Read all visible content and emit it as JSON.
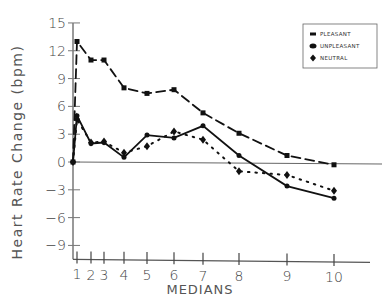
{
  "chart_data": {
    "type": "line",
    "title": "",
    "xlabel": "MEDIANS",
    "ylabel": "Heart Rate Change (bpm)",
    "x": [
      0,
      1,
      2,
      3,
      4,
      5,
      6,
      7,
      8,
      9,
      10
    ],
    "x_tick_labels": [
      "1",
      "2",
      "3",
      "4",
      "5",
      "6",
      "7",
      "8",
      "9",
      "10"
    ],
    "y_ticks": [
      15,
      12,
      9,
      6,
      3,
      0,
      -3,
      -6,
      -9
    ],
    "ylim": [
      -10,
      15
    ],
    "legend_position": "upper right",
    "grid": false,
    "series": [
      {
        "name": "PLEASANT",
        "style": "dashed",
        "marker": "square",
        "values": [
          0,
          13,
          11,
          11,
          8,
          7.4,
          7.8,
          5.3,
          3.1,
          0.7,
          -0.3
        ]
      },
      {
        "name": "UNPLEASANT",
        "style": "solid",
        "marker": "circle",
        "values": [
          0,
          5,
          2,
          2.1,
          0.5,
          2.9,
          2.6,
          3.9,
          0.7,
          -2.6,
          -3.9
        ]
      },
      {
        "name": "NEUTRAL",
        "style": "dotted",
        "marker": "diamond",
        "values": [
          0,
          4.6,
          2.1,
          2.2,
          1,
          1.7,
          3.3,
          2.4,
          -1,
          -1.4,
          -3.1
        ]
      }
    ]
  },
  "layout": {
    "x_pixels": [
      73,
      77,
      91,
      104,
      124,
      147,
      174,
      203,
      239,
      287,
      334
    ],
    "y_zero_px": 162,
    "px_per_unit": 9.27
  }
}
